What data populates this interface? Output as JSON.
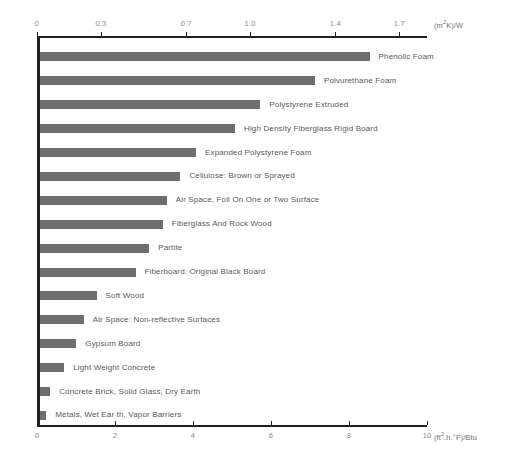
{
  "chart_data": {
    "type": "bar",
    "orientation": "horizontal",
    "title": "",
    "xlabel": "(ft².h.°F)/Btu",
    "ylabel": "",
    "top_axis_label": "(m²K)/W",
    "bottom_axis_label": "(ft².h.°F)/Btu",
    "grid": false,
    "legend": "none",
    "xlim_bottom": [
      0,
      10.4
    ],
    "xlim_top": [
      0,
      1.83
    ],
    "top_ticks": [
      "0",
      "0.3",
      "0.7",
      "1.0",
      "1.4",
      "1.7"
    ],
    "top_tick_values": [
      0,
      0.3,
      0.7,
      1.0,
      1.4,
      1.7
    ],
    "bottom_ticks": [
      "0",
      "2",
      "4",
      "6",
      "8",
      "10"
    ],
    "bottom_tick_values": [
      0,
      2,
      4,
      6,
      8,
      10
    ],
    "categories": [
      "Phenolic Foam",
      "Polvurethane Foam",
      "Polystyrene Extruded",
      "High Density Fiberglass Rigid Board",
      "Expanded Polystyrene Foam",
      "Cellulose: Brown or Sprayed",
      "Air Space, Foil On One or Two Surface",
      "Fiberglass And Rock Wood",
      "Partite",
      "Fiberboard: Original Black Board",
      "Soft Wood",
      "Air Space: Non-reflective Surfaces",
      "Gypsum Board",
      "Light Weight Concrete",
      "Concrete Brick, Solid Glass, Dry Earth",
      "Metals, Wet Ear th, Vapor Barriers"
    ],
    "values": [
      8.45,
      7.05,
      5.65,
      5.0,
      4.0,
      3.6,
      3.25,
      3.15,
      2.8,
      2.45,
      1.45,
      1.12,
      0.93,
      0.62,
      0.26,
      0.16
    ],
    "units_bottom": "(ft².h.°F)/Btu",
    "units_top": "(m²K)/W",
    "bar_color": "#6e6e6e",
    "axis_color": "#231f20",
    "label_color": "#58595b",
    "tick_label_color": "#8a8a8a"
  }
}
